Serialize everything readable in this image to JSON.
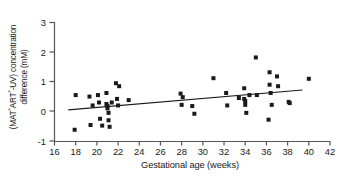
{
  "chart_data": {
    "type": "scatter",
    "title": "",
    "xlabel": "Gestational age (weeks)",
    "ylabel_line1": "(MAT*ART*-UV) concentration",
    "ylabel_line2": "difference (mM)",
    "ylabel_plain": "(MAT*ART*-UV) concentration difference (mM)",
    "xlim": [
      16,
      42
    ],
    "ylim": [
      -1,
      3
    ],
    "xticks": [
      16,
      18,
      20,
      22,
      24,
      26,
      28,
      30,
      32,
      34,
      36,
      38,
      40,
      42
    ],
    "yticks": [
      3,
      2,
      1,
      0,
      -1
    ],
    "ytick_labels": [
      "3",
      "2",
      "1",
      "0",
      "-1"
    ],
    "grid": false,
    "legend": false,
    "marker": "square",
    "marker_color": "#1a1a1a",
    "marker_size": 4,
    "x": [
      17.9,
      18.0,
      19.3,
      19.4,
      19.6,
      20.1,
      20.2,
      20.3,
      20.5,
      20.9,
      20.9,
      21.0,
      21.0,
      21.1,
      21.1,
      21.2,
      21.4,
      21.8,
      21.9,
      22.0,
      22.1,
      23.0,
      27.9,
      28.0,
      28.1,
      29.0,
      29.2,
      31.0,
      32.2,
      32.3,
      33.4,
      33.9,
      33.9,
      34.0,
      34.0,
      34.1,
      34.4,
      35.0,
      35.1,
      36.2,
      36.3,
      36.3,
      36.4,
      36.5,
      37.0,
      37.1,
      38.1,
      38.2,
      40.0
    ],
    "y": [
      -0.62,
      0.55,
      0.5,
      -0.46,
      0.2,
      0.55,
      0.3,
      -0.25,
      -0.48,
      0.62,
      0.25,
      0.18,
      0.1,
      -0.05,
      -0.3,
      -0.52,
      0.3,
      0.95,
      0.42,
      0.2,
      0.85,
      0.38,
      0.6,
      0.22,
      0.48,
      0.18,
      -0.08,
      1.12,
      0.62,
      0.2,
      0.45,
      0.78,
      0.42,
      0.35,
      0.22,
      -0.05,
      0.55,
      1.82,
      0.55,
      -0.28,
      1.32,
      0.9,
      0.62,
      0.22,
      1.18,
      0.85,
      0.32,
      0.28,
      1.1
    ],
    "trendline": {
      "type": "linear",
      "x_start": 17.3,
      "y_start": 0.05,
      "x_end": 39.4,
      "y_end": 0.72,
      "color": "#1a1a1a"
    }
  },
  "axes": {
    "x_axis_name": "gestational-age-axis",
    "y_axis_name": "concentration-difference-axis"
  }
}
